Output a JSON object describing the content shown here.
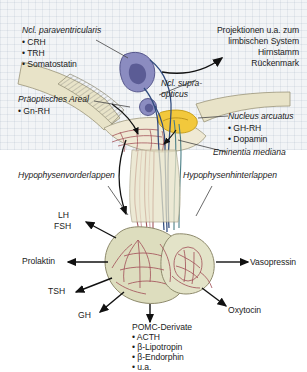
{
  "figure": {
    "language": "de",
    "colors": {
      "background": "#ffffff",
      "grid_tint": "#f2f4f6",
      "brain_tissue": "#e8e3c8",
      "nucleus_purple": "#8b8cc0",
      "nucleus_purple_dark": "#5b5c95",
      "arcuate_yellow": "#f2c83c",
      "pituitary_fill": "#ddddbe",
      "vessel_maroon": "#a4555c",
      "axon_blue": "#2f4a7c",
      "axon_teal": "#4a7f86",
      "text": "#1b1b1b",
      "leader_line": "#444444"
    }
  },
  "labels": {
    "paraventricular": {
      "name": "Ncl. paraventricularis",
      "items": [
        "• CRH",
        "• TRH",
        "• Somatostatin"
      ]
    },
    "projections": {
      "lines": [
        "Projektionen u.a. zum",
        "limbischen System",
        "Hirnstamm",
        "Rückenmark"
      ]
    },
    "preoptic": {
      "name": "Präoptisches Areal",
      "items": [
        "• Gn-RH"
      ]
    },
    "supraoptic": {
      "line1": "Ncl. supra-",
      "line2": "opticus"
    },
    "arcuate": {
      "name": "Nucleus arcuatus",
      "items": [
        "• GH-RH",
        "• Dopamin"
      ]
    },
    "eminentia": "Eminentia mediana",
    "anterior_lobe": "Hypophysenvorderlappen",
    "posterior_lobe": "Hypophysenhinterlappen"
  },
  "hormones": {
    "anterior": [
      {
        "id": "lh",
        "label": "LH"
      },
      {
        "id": "fsh",
        "label": "FSH"
      },
      {
        "id": "prolaktin",
        "label": "Prolaktin"
      },
      {
        "id": "tsh",
        "label": "TSH"
      },
      {
        "id": "gh",
        "label": "GH"
      }
    ],
    "pomc": {
      "title": "POMC-Derivate",
      "items": [
        "• ACTH",
        "• β-Lipotropin",
        "• β-Endorphin",
        "• u.a."
      ]
    },
    "posterior": [
      {
        "id": "vasopressin",
        "label": "Vasopressin"
      },
      {
        "id": "oxytocin",
        "label": "Oxytocin"
      }
    ]
  }
}
